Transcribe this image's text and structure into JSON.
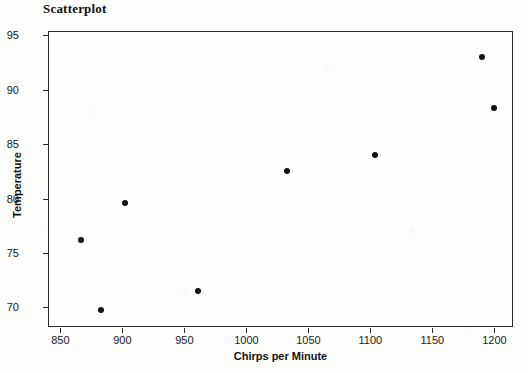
{
  "chart_data": {
    "type": "scatter",
    "title": "Scatterplot",
    "xlabel": "Chirps per Minute",
    "ylabel": "Temperature",
    "xlim": [
      840,
      1215
    ],
    "ylim": [
      68.2,
      95.4
    ],
    "xticks": [
      850,
      900,
      950,
      1000,
      1050,
      1100,
      1150,
      1200
    ],
    "yticks": [
      70,
      75,
      80,
      85,
      90,
      95
    ],
    "grid": false,
    "legend": null,
    "marker": "filled-circle",
    "marker_color": "#111111",
    "points": [
      {
        "x": 867,
        "y": 76.2
      },
      {
        "x": 883,
        "y": 69.8
      },
      {
        "x": 902,
        "y": 79.6
      },
      {
        "x": 961,
        "y": 71.5
      },
      {
        "x": 1033,
        "y": 82.5
      },
      {
        "x": 1104,
        "y": 84.0
      },
      {
        "x": 1190,
        "y": 93.0
      },
      {
        "x": 1200,
        "y": 88.3
      }
    ]
  }
}
